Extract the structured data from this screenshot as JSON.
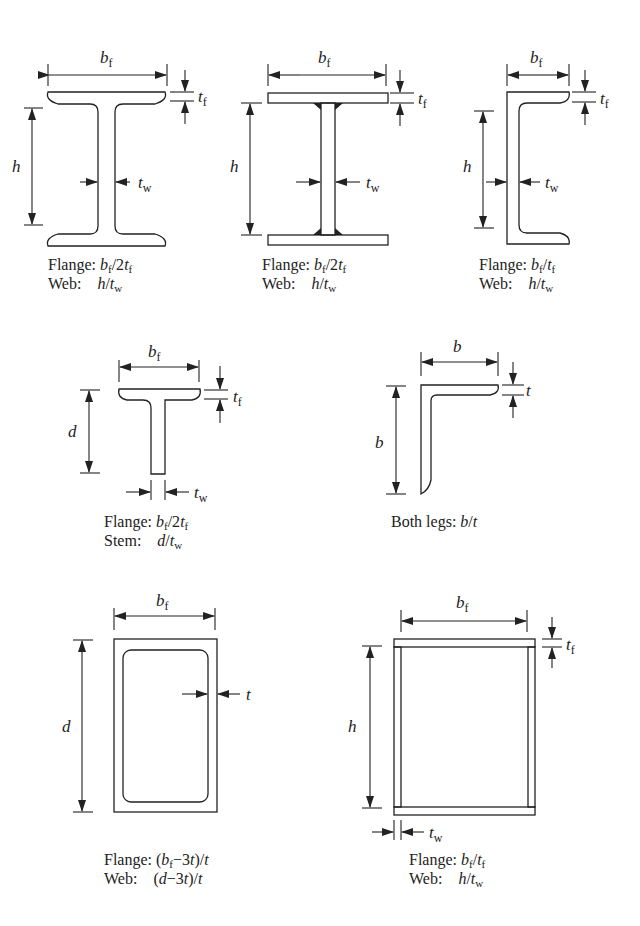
{
  "figure": {
    "sections": [
      {
        "id": "rolled-w-shape",
        "dims": [
          "b_f",
          "t_f",
          "h",
          "t_w"
        ],
        "caption": [
          {
            "label": "Flange:",
            "ratio": "b_f/2t_f"
          },
          {
            "label": "Web:",
            "ratio": "h/t_w"
          }
        ]
      },
      {
        "id": "welded-i-shape",
        "dims": [
          "b_f",
          "t_f",
          "h",
          "t_w"
        ],
        "caption": [
          {
            "label": "Flange:",
            "ratio": "b_f/2t_f"
          },
          {
            "label": "Web:",
            "ratio": "h/t_w"
          }
        ]
      },
      {
        "id": "channel",
        "dims": [
          "b_f",
          "t_f",
          "h",
          "t_w"
        ],
        "caption": [
          {
            "label": "Flange:",
            "ratio": "b_f/t_f"
          },
          {
            "label": "Web:",
            "ratio": "h/t_w"
          }
        ]
      },
      {
        "id": "tee",
        "dims": [
          "b_f",
          "t_f",
          "d",
          "t_w"
        ],
        "caption": [
          {
            "label": "Flange:",
            "ratio": "b_f/2t_f"
          },
          {
            "label": "Stem:",
            "ratio": "d/t_w"
          }
        ]
      },
      {
        "id": "angle",
        "dims": [
          "b",
          "b",
          "t"
        ],
        "caption": [
          {
            "label": "Both legs:",
            "ratio": "b/t"
          }
        ]
      },
      {
        "id": "rectangular-hss",
        "dims": [
          "b_f",
          "d",
          "t"
        ],
        "caption": [
          {
            "label": "Flange:",
            "ratio": "(b_f−3t)/t"
          },
          {
            "label": "Web:",
            "ratio": "(d−3t)/t"
          }
        ]
      },
      {
        "id": "box-section",
        "dims": [
          "b_f",
          "t_f",
          "h",
          "t_w"
        ],
        "caption": [
          {
            "label": "Flange:",
            "ratio": "b_f/t_f"
          },
          {
            "label": "Web:",
            "ratio": "h/t_w"
          }
        ]
      }
    ],
    "labels": {
      "b": "b",
      "h": "h",
      "d": "d",
      "t": "t",
      "sub_f": "f",
      "sub_w": "w",
      "flange": "Flange:",
      "web": "Web:",
      "stem": "Stem:",
      "both_legs": "Both legs:"
    }
  }
}
